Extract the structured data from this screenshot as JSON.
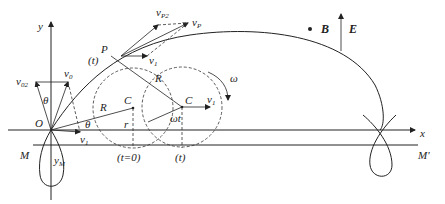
{
  "diagram": {
    "fields": {
      "B_label": "B",
      "E_label": "E",
      "B_symbol": "•"
    },
    "axes": {
      "x_label": "x",
      "y_label": "y",
      "origin_label": "O"
    },
    "lines": {
      "M_left": "M",
      "M_right": "M'",
      "yM_label": "y",
      "yM_sub": "M"
    },
    "velocities": {
      "v0": {
        "base": "v",
        "sub": "0"
      },
      "v02": {
        "base": "v",
        "sub": "02"
      },
      "v1": {
        "base": "v",
        "sub": "1"
      },
      "vP": {
        "base": "v",
        "sub": "P"
      },
      "vP2": {
        "base": "v",
        "sub": "P2"
      }
    },
    "angles": {
      "theta": "θ",
      "omega": "ω",
      "omega_t": "ωt"
    },
    "points": {
      "P": "P",
      "C": "C",
      "t_label": "(t)"
    },
    "radii": {
      "R": "R",
      "r": "r"
    },
    "time_marks": {
      "t0": "(t=0)",
      "t": "(t)"
    }
  }
}
